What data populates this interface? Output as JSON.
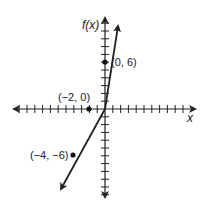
{
  "chart_data": {
    "type": "line",
    "title": "",
    "xlabel": "x",
    "ylabel": "f(x)",
    "xlim": [
      -11,
      10
    ],
    "ylim": [
      -11,
      11
    ],
    "grid": false,
    "series": [
      {
        "name": "f(x) = 3x + 6",
        "x": [
          -4,
          -2,
          0
        ],
        "y": [
          -6,
          0,
          6
        ]
      }
    ],
    "points": [
      {
        "x": 0,
        "y": 6,
        "label": "(0, 6)"
      },
      {
        "x": -2,
        "y": 0,
        "label": "(−2, 0)"
      },
      {
        "x": -4,
        "y": -6,
        "label": "(−4, −6)"
      }
    ]
  },
  "labels": {
    "x_axis": "x",
    "y_axis": "f(x)",
    "p1": "(0, 6)",
    "p2": "(−2, 0)",
    "p3": "(−4, −6)"
  }
}
